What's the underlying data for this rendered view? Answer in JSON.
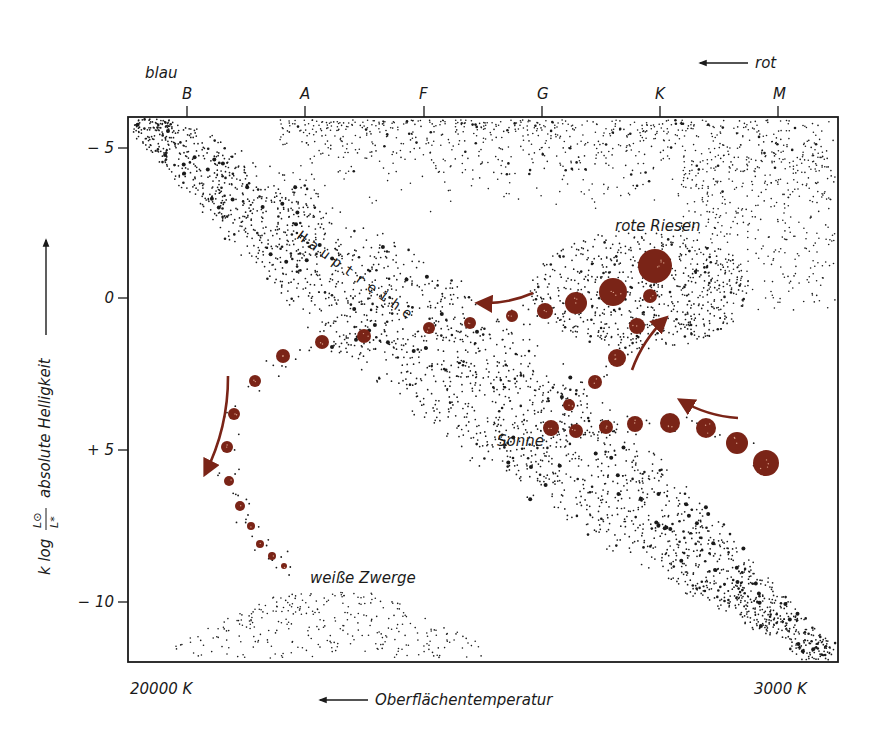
{
  "figure": {
    "colors": {
      "ink": "#1a1a1a",
      "track": "#7a2417",
      "track_highlight": "#d9a08a",
      "background": "#ffffff"
    },
    "frame": {
      "x0": 128,
      "y0": 117,
      "x1": 838,
      "y1": 662
    },
    "top_labels": {
      "blue": "blau",
      "red": "rot",
      "red_arrow": "arrow-left"
    },
    "spectral_classes": [
      {
        "label": "B",
        "x": 187
      },
      {
        "label": "A",
        "x": 305
      },
      {
        "label": "F",
        "x": 424
      },
      {
        "label": "G",
        "x": 542
      },
      {
        "label": "K",
        "x": 660
      },
      {
        "label": "M",
        "x": 778
      }
    ],
    "y_ticks": [
      {
        "label": "− 5",
        "y": 148
      },
      {
        "label": "0",
        "y": 298
      },
      {
        "label": "+ 5",
        "y": 450
      },
      {
        "label": "− 10",
        "y": 602
      }
    ],
    "y_axis_label": {
      "formula_prefix": "k log",
      "numerator": "L⊙",
      "denominator": "L*",
      "text": "absolute Helligkeit"
    },
    "x_axis": {
      "left_label": "20000 K",
      "right_label": "3000 K",
      "title": "Oberflächentemperatur"
    },
    "annotations": {
      "main_sequence": "Hauptreihe",
      "red_giants": "rote Riesen",
      "sun": "Sonne",
      "white_dwarfs": "weiße Zwerge"
    }
  },
  "chart_data": {
    "type": "scatter",
    "title": "",
    "xlabel": "Oberflächentemperatur",
    "ylabel": "k log (L⊙ / L*)  absolute Helligkeit",
    "x_tick_labels": [
      "B",
      "A",
      "F",
      "G",
      "K",
      "M"
    ],
    "x_range_labels": [
      "20000 K",
      "3000 K"
    ],
    "y_tick_labels": [
      "-5",
      "0",
      "+5",
      "-10"
    ],
    "ylim": [
      -6,
      12
    ],
    "grid": false,
    "legend": null,
    "regions": [
      {
        "name": "Hauptreihe",
        "description": "diagonal band of stars from upper-left (B) to lower-right (M)"
      },
      {
        "name": "rote Riesen",
        "description": "dense cluster near K, magnitude ~0"
      },
      {
        "name": "weiße Zwerge",
        "description": "sparse cluster lower-left, magnitude ~+10 to +12"
      },
      {
        "name": "Sonne",
        "description": "G-type star on main sequence, magnitude ~+5"
      }
    ],
    "evolution_track": {
      "color": "#7a2417",
      "description": "Evolution of a star: contracting protostar moves left onto main sequence (Sonne), swells to red giant, then moves left across diagram and descends to white dwarf",
      "points": [
        {
          "x": 766,
          "y": 463,
          "r": 13,
          "stage": "protostar"
        },
        {
          "x": 737,
          "y": 443,
          "r": 11
        },
        {
          "x": 706,
          "y": 428,
          "r": 10
        },
        {
          "x": 670,
          "y": 423,
          "r": 10
        },
        {
          "x": 635,
          "y": 424,
          "r": 8
        },
        {
          "x": 606,
          "y": 427,
          "r": 7
        },
        {
          "x": 576,
          "y": 431,
          "r": 7
        },
        {
          "x": 551,
          "y": 428,
          "r": 8,
          "stage": "Sonne"
        },
        {
          "x": 569,
          "y": 405,
          "r": 6
        },
        {
          "x": 595,
          "y": 382,
          "r": 7
        },
        {
          "x": 617,
          "y": 358,
          "r": 9
        },
        {
          "x": 637,
          "y": 326,
          "r": 8
        },
        {
          "x": 650,
          "y": 296,
          "r": 7
        },
        {
          "x": 655,
          "y": 266,
          "r": 17,
          "stage": "rote Riesen"
        },
        {
          "x": 613,
          "y": 292,
          "r": 14
        },
        {
          "x": 576,
          "y": 303,
          "r": 11
        },
        {
          "x": 545,
          "y": 311,
          "r": 8
        },
        {
          "x": 512,
          "y": 316,
          "r": 6
        },
        {
          "x": 470,
          "y": 323,
          "r": 6
        },
        {
          "x": 429,
          "y": 328,
          "r": 6
        },
        {
          "x": 364,
          "y": 336,
          "r": 7
        },
        {
          "x": 322,
          "y": 342,
          "r": 7
        },
        {
          "x": 283,
          "y": 356,
          "r": 7
        },
        {
          "x": 255,
          "y": 381,
          "r": 6
        },
        {
          "x": 234,
          "y": 414,
          "r": 6
        },
        {
          "x": 227,
          "y": 447,
          "r": 6
        },
        {
          "x": 229,
          "y": 481,
          "r": 5
        },
        {
          "x": 240,
          "y": 506,
          "r": 5
        },
        {
          "x": 251,
          "y": 526,
          "r": 4
        },
        {
          "x": 260,
          "y": 544,
          "r": 4
        },
        {
          "x": 272,
          "y": 556,
          "r": 4
        },
        {
          "x": 284,
          "y": 566,
          "r": 3,
          "stage": "weiße Zwerge"
        }
      ],
      "arrows": [
        {
          "from": [
            738,
            418
          ],
          "to": [
            680,
            400
          ],
          "meaning": "protostar contracting toward main sequence"
        },
        {
          "from": [
            632,
            370
          ],
          "to": [
            666,
            318
          ],
          "meaning": "expansion to red giant"
        },
        {
          "from": [
            533,
            293
          ],
          "to": [
            478,
            303
          ],
          "meaning": "moves left across diagram"
        },
        {
          "from": [
            228,
            376
          ],
          "to": [
            205,
            474
          ],
          "meaning": "descends toward white dwarf"
        }
      ]
    }
  }
}
